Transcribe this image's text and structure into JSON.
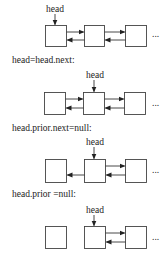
{
  "diagram": {
    "type": "doubly-linked-list-deletion-steps",
    "head_label": "head",
    "ellipsis": "...",
    "steps": [
      {
        "caption": "",
        "head_at": 0,
        "links": [
          "0-1 both",
          "1-2 both"
        ]
      },
      {
        "caption": "head=head.next:",
        "head_at": 1,
        "links": [
          "0-1 both",
          "1-2 both"
        ]
      },
      {
        "caption": "head.prior.next=null:",
        "head_at": 1,
        "links": [
          "1->0 prior only",
          "1-2 both"
        ]
      },
      {
        "caption": "head.prior =null:",
        "head_at": 1,
        "links": [
          "1-2 both"
        ]
      }
    ]
  },
  "captions": {
    "step2": "head=head.next:",
    "step3": "head.prior.next=null:",
    "step4": "head.prior =null:"
  },
  "labels": {
    "head": "head",
    "dots": "..."
  }
}
